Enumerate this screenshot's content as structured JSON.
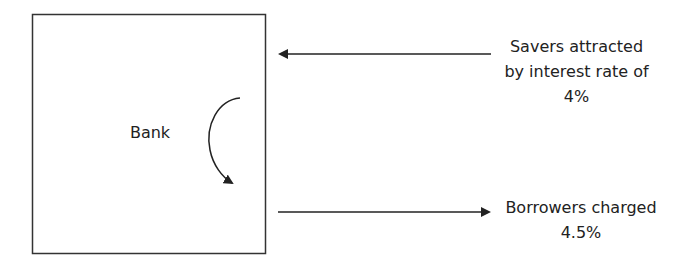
{
  "diagram": {
    "box_label": "Bank",
    "savers": {
      "lines": [
        "Savers attracted",
        "by interest rate of",
        "4%"
      ]
    },
    "borrowers": {
      "lines": [
        "Borrowers charged",
        "4.5%"
      ]
    },
    "colors": {
      "stroke": "#222222",
      "background": "#ffffff"
    }
  }
}
